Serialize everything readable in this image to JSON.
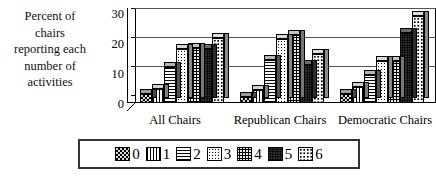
{
  "chart_data": {
    "type": "bar",
    "title": "",
    "subtitle": "",
    "ylabel": "Percent of chairs reporting each number of activities",
    "ylabel_lines": [
      "Percent of",
      "chairs",
      "reporting each",
      "number of",
      "activities"
    ],
    "xlabel": "",
    "categories": [
      "All Chairs",
      "Republican Chairs",
      "Democratic Chairs"
    ],
    "ylim": [
      0,
      30
    ],
    "yticks": [
      0,
      10,
      20,
      30
    ],
    "ytick_labels": [
      "0",
      "10",
      "20",
      "30"
    ],
    "grid": true,
    "legend_position": "bottom",
    "legend_title": "",
    "style": "3d-bar",
    "series": [
      {
        "name": "0",
        "values": [
          3,
          2,
          3
        ]
      },
      {
        "name": "1",
        "values": [
          5,
          4.5,
          5.5
        ]
      },
      {
        "name": "2",
        "values": [
          12.5,
          15,
          9.5
        ]
      },
      {
        "name": "3",
        "values": [
          18.5,
          22,
          14.5
        ]
      },
      {
        "name": "4",
        "values": [
          19,
          23.5,
          14.5
        ]
      },
      {
        "name": "5",
        "values": [
          18.5,
          13,
          24
        ]
      },
      {
        "name": "6",
        "values": [
          22.5,
          17,
          30
        ]
      }
    ]
  },
  "legend": {
    "entries": [
      {
        "label": "0"
      },
      {
        "label": "1"
      },
      {
        "label": "2"
      },
      {
        "label": "3"
      },
      {
        "label": "4"
      },
      {
        "label": "5"
      },
      {
        "label": "6"
      }
    ]
  },
  "colors": {
    "axis": "#000000",
    "grid": "#555555",
    "background": "#ffffff",
    "legend_border": "#333333"
  }
}
